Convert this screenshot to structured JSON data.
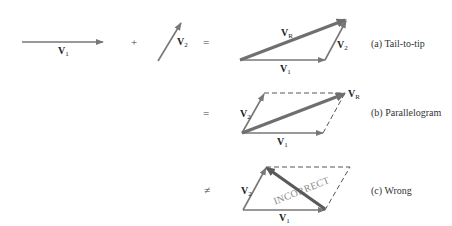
{
  "figure": {
    "inputs": {
      "v1": {
        "label": "V",
        "sub": "1"
      },
      "plus": "+",
      "v2": {
        "label": "V",
        "sub": "2"
      },
      "equals": "="
    },
    "panels": [
      {
        "id": "a",
        "operator": "",
        "caption": "(a) Tail-to-tip",
        "labels": {
          "vr": {
            "label": "V",
            "sub": "R"
          },
          "v1": {
            "label": "V",
            "sub": "1"
          },
          "v2": {
            "label": "V",
            "sub": "2"
          }
        }
      },
      {
        "id": "b",
        "operator": "=",
        "caption": "(b) Parallelogram",
        "labels": {
          "vr": {
            "label": "V",
            "sub": "R"
          },
          "v1": {
            "label": "V",
            "sub": "1"
          },
          "v2": {
            "label": "V",
            "sub": "2"
          }
        }
      },
      {
        "id": "c",
        "operator": "≠",
        "caption": "(c) Wrong",
        "stamp": "INCORRECT",
        "labels": {
          "v1": {
            "label": "V",
            "sub": "1"
          },
          "v2": {
            "label": "V",
            "sub": "2"
          }
        }
      }
    ],
    "colors": {
      "vector": "#777777",
      "resultant": "#6f6f6f",
      "dash": "#555555",
      "wrong": "#5a5a5a"
    }
  }
}
